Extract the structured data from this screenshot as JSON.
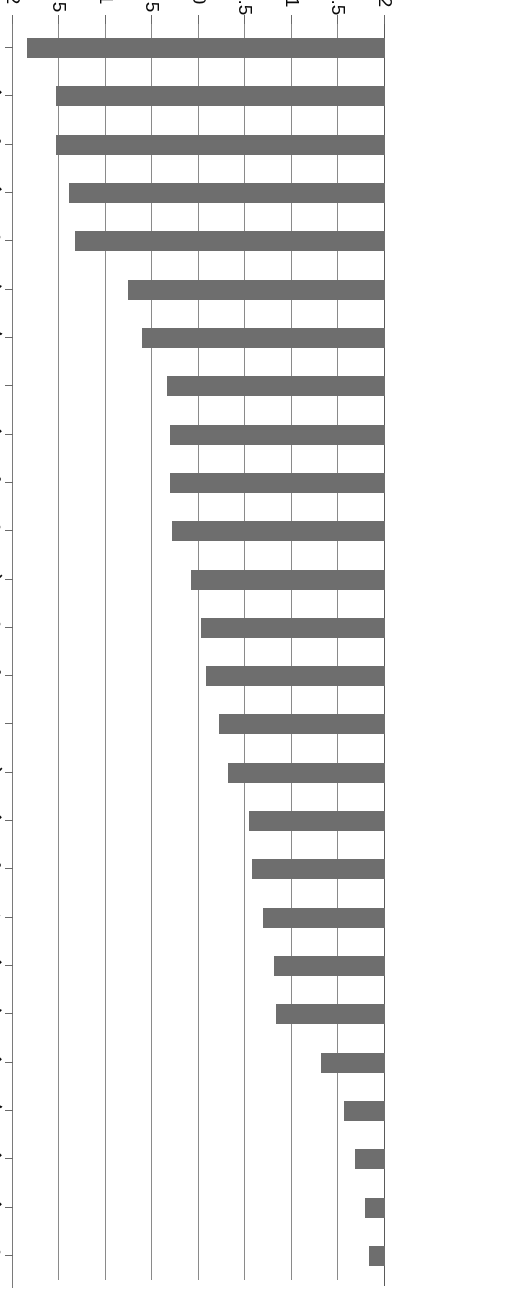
{
  "chart_data": {
    "type": "bar",
    "orientation": "horizontal",
    "title": "",
    "subtitle": "",
    "xlabel": "",
    "ylabel": "",
    "axis_range": [
      -2,
      2
    ],
    "axis_ticks": [
      "2",
      "1.5",
      "1",
      "0.5",
      "0",
      "-0.5",
      "-1",
      "-1.5",
      "-2"
    ],
    "axis_tick_values": [
      2,
      1.5,
      1,
      0.5,
      0,
      -0.5,
      -1,
      -1.5,
      -2
    ],
    "grid": true,
    "legend": null,
    "bar_color": "#6e6e6e",
    "background_color": "#ffffff",
    "axis_color": "#8a8a8a",
    "categories": [
      "App. Inner-R",
      "Nidwalden",
      "Schwyz",
      "Uri",
      "Obwalden",
      "Zug",
      "Valais",
      "Aargau",
      "Lucerne",
      "St Gall",
      "Glarus",
      "Thurgau",
      "Grisons",
      "Solothurn",
      "App. Outer-R",
      "Ticino",
      "Fribourg",
      "Schaffhausen",
      "Jura",
      "Basel-Country",
      "Zurich",
      "Berne",
      "Vaud",
      "Basel-City",
      "Neuchatel",
      "Geneva"
    ],
    "values": [
      1.85,
      1.54,
      1.54,
      1.4,
      1.33,
      0.76,
      0.61,
      0.34,
      0.31,
      0.31,
      0.29,
      0.09,
      -0.02,
      -0.08,
      -0.22,
      -0.31,
      -0.54,
      -0.57,
      -0.69,
      -0.81,
      -0.83,
      -1.31,
      -1.56,
      -1.68,
      -1.79,
      -1.83
    ]
  }
}
